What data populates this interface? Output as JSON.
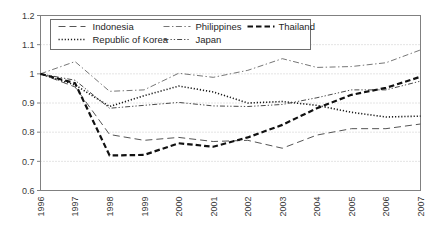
{
  "chart_data": {
    "type": "line",
    "title": "",
    "subtitle": "",
    "xlabel": "",
    "ylabel": "",
    "x": [
      1996,
      1997,
      1998,
      1999,
      2000,
      2001,
      2002,
      2003,
      2004,
      2005,
      2006,
      2007
    ],
    "categories": [
      "1996",
      "1997",
      "1998",
      "1999",
      "2000",
      "2001",
      "2002",
      "2003",
      "2004",
      "2005",
      "2006",
      "2007"
    ],
    "xlim": [
      1996,
      2007
    ],
    "ylim": [
      0.6,
      1.2
    ],
    "yticks": [
      0.6,
      0.7,
      0.8,
      0.9,
      1,
      1.1,
      1.2
    ],
    "ytick_labels": [
      "0.6",
      "0.7",
      "0.8",
      "0.9",
      "1",
      "1.1",
      "1.2"
    ],
    "xtick_labels": [
      "1996",
      "1997",
      "1998",
      "1999",
      "2000",
      "2001",
      "2002",
      "2003",
      "2004",
      "2005",
      "2006",
      "2007"
    ],
    "grid": "horizontal-dotted",
    "legend_position": "top-left-inside",
    "series": [
      {
        "name": "Indonesia",
        "style": "long-dash",
        "color": "#555555",
        "values": [
          1.0,
          0.955,
          0.792,
          0.772,
          0.782,
          0.768,
          0.772,
          0.745,
          0.79,
          0.812,
          0.812,
          0.828
        ]
      },
      {
        "name": "Republic of Korea",
        "style": "dotted",
        "color": "#1a1a1a",
        "values": [
          1.0,
          0.962,
          0.888,
          0.925,
          0.958,
          0.938,
          0.9,
          0.905,
          0.892,
          0.868,
          0.852,
          0.855
        ]
      },
      {
        "name": "Philippines",
        "style": "dash-dot-thin",
        "color": "#666666",
        "values": [
          1.0,
          1.042,
          0.94,
          0.945,
          1.002,
          0.988,
          1.012,
          1.052,
          1.022,
          1.025,
          1.038,
          1.082
        ]
      },
      {
        "name": "Japan",
        "style": "dash-dot-dot",
        "color": "#4a4a4a",
        "values": [
          1.0,
          0.978,
          0.882,
          0.892,
          0.902,
          0.89,
          0.888,
          0.895,
          0.918,
          0.945,
          0.945,
          0.975
        ]
      },
      {
        "name": "Thailand",
        "style": "heavy-dash",
        "color": "#111111",
        "values": [
          1.0,
          0.968,
          0.72,
          0.722,
          0.762,
          0.75,
          0.782,
          0.825,
          0.882,
          0.928,
          0.952,
          0.99
        ]
      }
    ]
  },
  "legend": {
    "entries": [
      {
        "label": "Indonesia"
      },
      {
        "label": "Philippines"
      },
      {
        "label": "Thailand"
      },
      {
        "label": "Republic of Korea"
      },
      {
        "label": "Japan"
      }
    ]
  },
  "axes": {
    "border_color": "#808080",
    "grid_color": "#c8c8c8",
    "tick_color": "#808080"
  }
}
